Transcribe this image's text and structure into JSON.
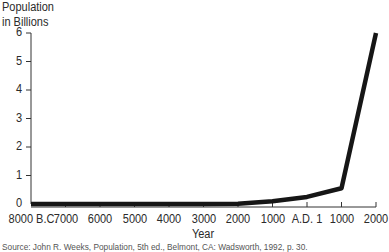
{
  "chart_data": {
    "type": "line",
    "title": "",
    "ylabel": "Population in Billions",
    "ylabel_lines": [
      "Population",
      "in Billions"
    ],
    "xlabel": "Year",
    "ylim": [
      0,
      6
    ],
    "yticks": [
      "0",
      "1",
      "2",
      "3",
      "4",
      "5",
      "6"
    ],
    "categories": [
      "8000 B.C.",
      "7000",
      "6000",
      "5000",
      "4000",
      "3000",
      "2000",
      "1000",
      "A.D. 1",
      "1000",
      "2000"
    ],
    "x": [
      -8000,
      -7000,
      -6000,
      -5000,
      -4000,
      -3000,
      -2000,
      -1000,
      1,
      1000,
      2000
    ],
    "series": [
      {
        "name": "World population",
        "values": [
          0.005,
          0.005,
          0.005,
          0.005,
          0.005,
          0.005,
          0.01,
          0.1,
          0.25,
          0.55,
          6.0
        ]
      }
    ],
    "grid": false,
    "legend": null,
    "source": "Source: John R. Weeks, Population, 5th ed., Belmont, CA: Wadsworth, 1992, p. 30."
  },
  "colors": {
    "line": "#161616",
    "axis": "#333333",
    "text": "#2b2b2b"
  }
}
